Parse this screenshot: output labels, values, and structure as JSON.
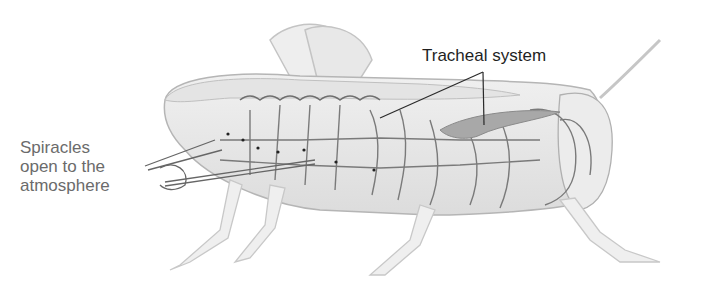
{
  "diagram": {
    "labels": {
      "tracheal_system": "Tracheal system",
      "spiracles_line1": "Spiracles",
      "spiracles_line2": "open to the",
      "spiracles_line3": "atmosphere"
    },
    "colors": {
      "body_fill": "#ececec",
      "body_stroke": "#b5b5b5",
      "trachea_stroke": "#7a7a7a",
      "leader_line": "#2a2a2a",
      "spiracle_label": "#6b6b6b",
      "tracheal_label": "#1f1f1f"
    }
  }
}
